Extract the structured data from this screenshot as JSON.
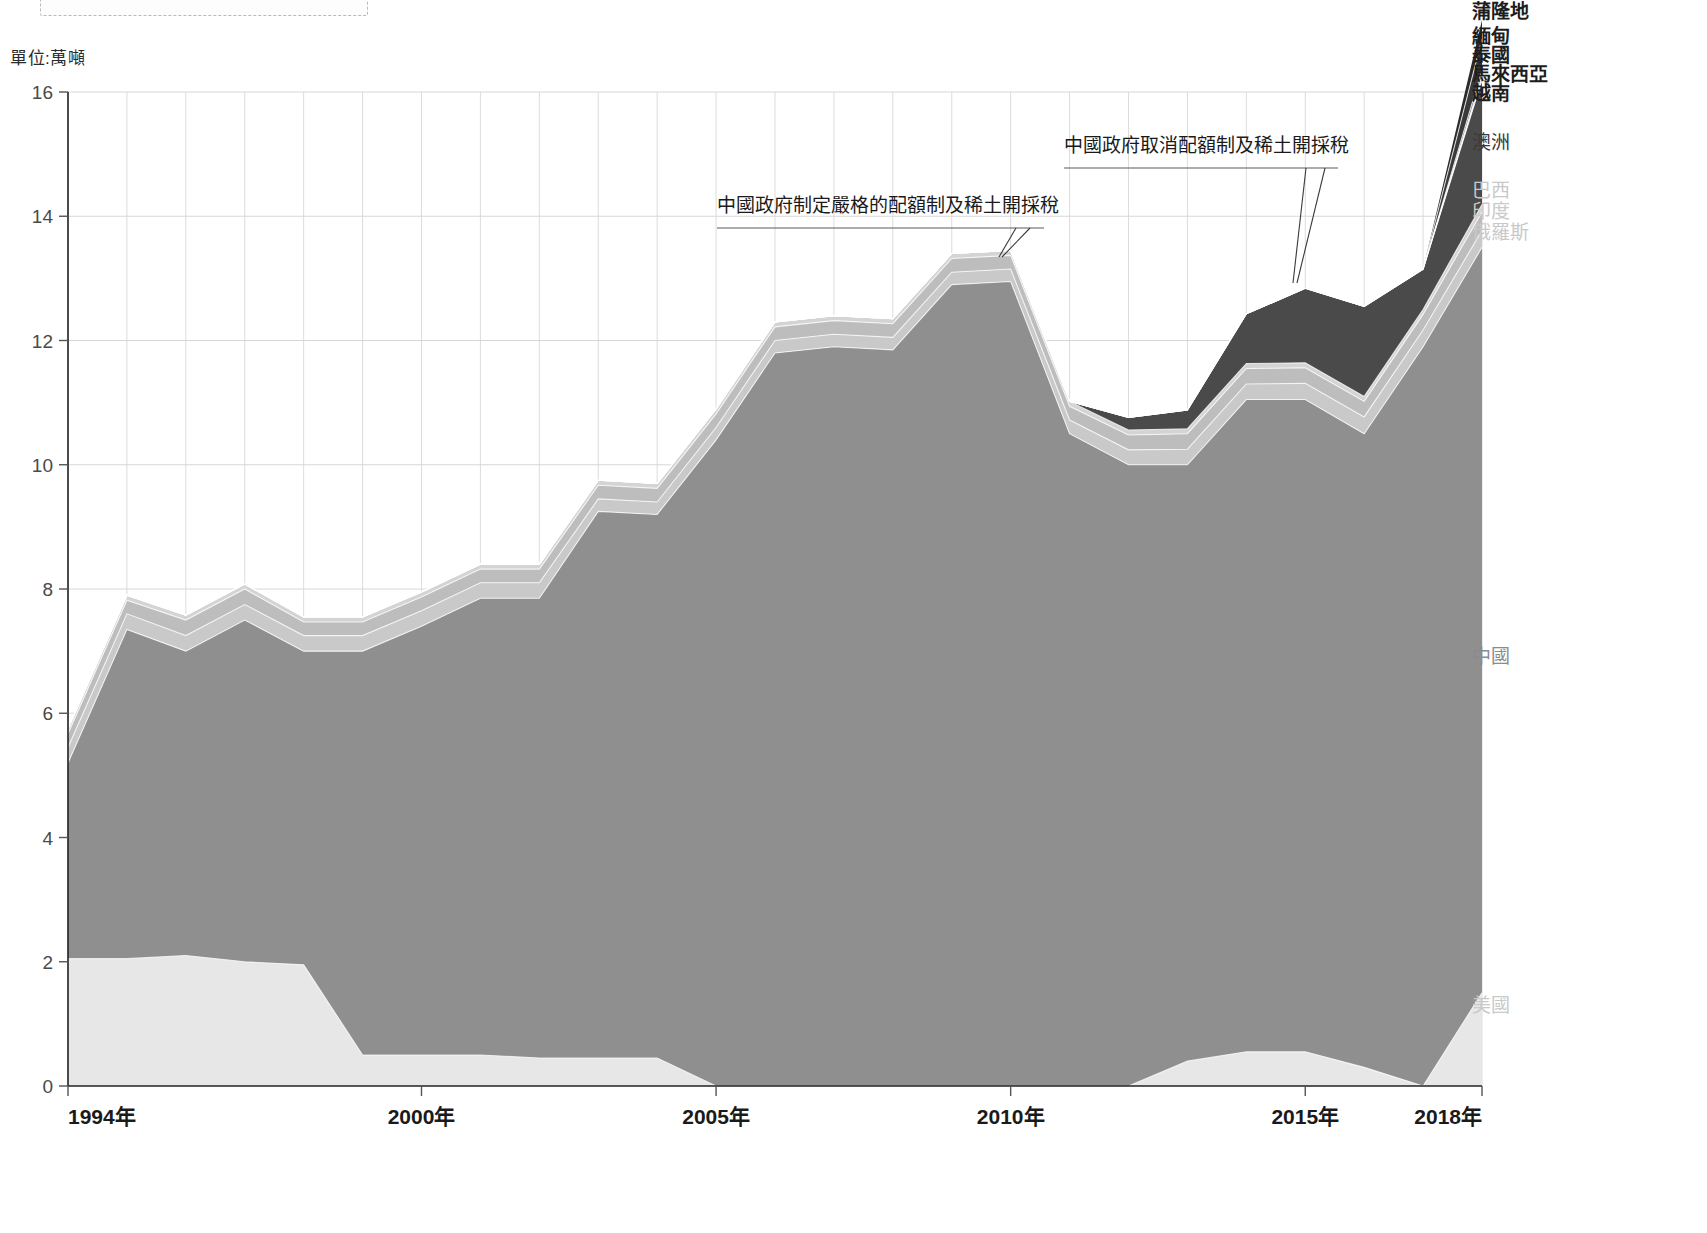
{
  "unit_label": "單位:萬噸",
  "axis": {
    "y_ticks": [
      "0",
      "2",
      "4",
      "6",
      "8",
      "10",
      "12",
      "14",
      "16"
    ],
    "y_min": 0,
    "y_max": 16,
    "x_ticks": [
      {
        "label": "1994年",
        "year": 1994
      },
      {
        "label": "2000年",
        "year": 2000
      },
      {
        "label": "2005年",
        "year": 2005
      },
      {
        "label": "2010年",
        "year": 2010
      },
      {
        "label": "2015年",
        "year": 2015
      },
      {
        "label": "2018年",
        "year": 2018
      }
    ]
  },
  "annotations": [
    {
      "id": "annotation-quota-introduced",
      "text": "中國政府制定嚴格的配額制及稀土開採稅",
      "target_year": 2010
    },
    {
      "id": "annotation-quota-cancelled",
      "text": "中國政府取消配額制及稀土開採稅",
      "target_year": 2015
    }
  ],
  "series_labels": [
    {
      "name": "蒲隆地",
      "tone": "dark",
      "y": 18
    },
    {
      "name": "緬甸",
      "tone": "dark",
      "y": 43
    },
    {
      "name": "泰國",
      "tone": "dark",
      "y": 62
    },
    {
      "name": "馬來西亞",
      "tone": "dark",
      "y": 81
    },
    {
      "name": "越南",
      "tone": "dark",
      "y": 100
    },
    {
      "name": "澳洲",
      "tone": "mid",
      "y": 149
    },
    {
      "name": "巴西",
      "tone": "light",
      "y": 197
    },
    {
      "name": "印度",
      "tone": "light",
      "y": 218
    },
    {
      "name": "俄羅斯",
      "tone": "light",
      "y": 239
    },
    {
      "name": "中國",
      "tone": "grayish",
      "y": 663
    },
    {
      "name": "美國",
      "tone": "light",
      "y": 1012
    }
  ],
  "colors": {
    "china": "#8f8f8f",
    "usa": "#e7e7e7",
    "russia": "#c9c9c9",
    "india": "#bdbdbd",
    "brazil": "#d4d4d4",
    "australia": "#4a4a4a",
    "vietnam": "#8a8a8a",
    "malaysia": "#b5b5b5",
    "thailand": "#6d6d6d",
    "myanmar": "#3a3a3a",
    "burundi": "#2a2a2a",
    "grid": "#d7d7d7",
    "axis": "#222222"
  },
  "chart_data": {
    "type": "area",
    "title": "",
    "subtitle": "",
    "xlabel": "",
    "ylabel": "單位:萬噸",
    "ylim": [
      0,
      16
    ],
    "xlim": [
      1994,
      2018
    ],
    "grid": true,
    "legend_position": "right-inline",
    "stacked": true,
    "x": [
      1994,
      1995,
      1996,
      1997,
      1998,
      1999,
      2000,
      2001,
      2002,
      2003,
      2004,
      2005,
      2006,
      2007,
      2008,
      2009,
      2010,
      2011,
      2012,
      2013,
      2014,
      2015,
      2016,
      2017,
      2018
    ],
    "series": [
      {
        "name": "美國",
        "color": "#e7e7e7",
        "values": [
          2.05,
          2.05,
          2.1,
          2.0,
          1.95,
          0.5,
          0.5,
          0.5,
          0.45,
          0.45,
          0.45,
          0.0,
          0.0,
          0.0,
          0.0,
          0.0,
          0.0,
          0.0,
          0.0,
          0.4,
          0.55,
          0.55,
          0.3,
          0.0,
          1.5
        ]
      },
      {
        "name": "中國",
        "color": "#8f8f8f",
        "values": [
          3.15,
          5.3,
          4.9,
          5.5,
          5.05,
          6.5,
          6.9,
          7.35,
          7.4,
          8.8,
          8.75,
          10.4,
          11.8,
          11.9,
          11.85,
          12.9,
          12.95,
          10.5,
          10.0,
          9.6,
          10.5,
          10.5,
          10.2,
          11.9,
          12.0
        ]
      },
      {
        "name": "俄羅斯",
        "color": "#c9c9c9",
        "values": [
          0.25,
          0.25,
          0.25,
          0.25,
          0.25,
          0.25,
          0.25,
          0.25,
          0.25,
          0.2,
          0.2,
          0.2,
          0.2,
          0.2,
          0.2,
          0.2,
          0.2,
          0.22,
          0.24,
          0.25,
          0.25,
          0.26,
          0.27,
          0.27,
          0.27
        ]
      },
      {
        "name": "印度",
        "color": "#bdbdbd",
        "values": [
          0.22,
          0.22,
          0.25,
          0.25,
          0.22,
          0.22,
          0.22,
          0.22,
          0.22,
          0.22,
          0.22,
          0.22,
          0.22,
          0.22,
          0.22,
          0.22,
          0.22,
          0.22,
          0.24,
          0.25,
          0.25,
          0.25,
          0.25,
          0.25,
          0.3
        ]
      },
      {
        "name": "巴西",
        "color": "#d4d4d4",
        "values": [
          0.08,
          0.08,
          0.08,
          0.08,
          0.08,
          0.08,
          0.08,
          0.08,
          0.08,
          0.08,
          0.08,
          0.08,
          0.08,
          0.08,
          0.08,
          0.08,
          0.08,
          0.08,
          0.08,
          0.08,
          0.08,
          0.08,
          0.08,
          0.08,
          0.12
        ]
      },
      {
        "name": "澳洲",
        "color": "#4a4a4a",
        "values": [
          0.0,
          0.0,
          0.0,
          0.0,
          0.0,
          0.0,
          0.0,
          0.0,
          0.0,
          0.0,
          0.0,
          0.0,
          0.0,
          0.0,
          0.0,
          0.0,
          0.0,
          0.0,
          0.2,
          0.3,
          0.8,
          1.2,
          1.45,
          0.65,
          2.0
        ]
      },
      {
        "name": "越南",
        "color": "#8a8a8a",
        "values": [
          0.0,
          0.0,
          0.0,
          0.0,
          0.0,
          0.0,
          0.0,
          0.0,
          0.0,
          0.0,
          0.0,
          0.0,
          0.0,
          0.0,
          0.0,
          0.0,
          0.0,
          0.0,
          0.0,
          0.0,
          0.0,
          0.0,
          0.0,
          0.0,
          0.04
        ]
      },
      {
        "name": "馬來西亞",
        "color": "#b5b5b5",
        "values": [
          0.0,
          0.0,
          0.0,
          0.0,
          0.0,
          0.0,
          0.0,
          0.0,
          0.0,
          0.0,
          0.0,
          0.0,
          0.0,
          0.0,
          0.0,
          0.0,
          0.0,
          0.0,
          0.0,
          0.0,
          0.0,
          0.0,
          0.0,
          0.0,
          0.03
        ]
      },
      {
        "name": "泰國",
        "color": "#6d6d6d",
        "values": [
          0.0,
          0.0,
          0.0,
          0.0,
          0.0,
          0.0,
          0.0,
          0.0,
          0.0,
          0.0,
          0.0,
          0.0,
          0.0,
          0.0,
          0.0,
          0.0,
          0.0,
          0.0,
          0.0,
          0.0,
          0.0,
          0.0,
          0.0,
          0.0,
          0.1
        ]
      },
      {
        "name": "緬甸",
        "color": "#3a3a3a",
        "values": [
          0.0,
          0.0,
          0.0,
          0.0,
          0.0,
          0.0,
          0.0,
          0.0,
          0.0,
          0.0,
          0.0,
          0.0,
          0.0,
          0.0,
          0.0,
          0.0,
          0.0,
          0.0,
          0.0,
          0.0,
          0.0,
          0.0,
          0.0,
          0.0,
          0.5
        ]
      },
      {
        "name": "蒲隆地",
        "color": "#2a2a2a",
        "values": [
          0.0,
          0.0,
          0.0,
          0.0,
          0.0,
          0.0,
          0.0,
          0.0,
          0.0,
          0.0,
          0.0,
          0.0,
          0.0,
          0.0,
          0.0,
          0.0,
          0.0,
          0.0,
          0.0,
          0.0,
          0.0,
          0.0,
          0.0,
          0.0,
          0.3
        ]
      }
    ]
  }
}
